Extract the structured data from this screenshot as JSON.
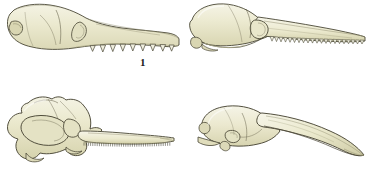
{
  "plate": {
    "title": "Comparative skull profiles plate",
    "background_color": "#ffffff",
    "width": 368,
    "height": 187,
    "layout": "2x2 grid of labeled skull illustrations"
  },
  "palette": {
    "bone_light": "#f2f1e0",
    "bone_mid": "#e8e6cc",
    "bone_shadow": "#d8d6b4",
    "bone_deep_shadow": "#c4c29c",
    "outline": "#4a4736",
    "outline_soft": "#6b6750",
    "tooth": "#efeede",
    "label_color": "#1a1a1a"
  },
  "figures": [
    {
      "id": "figure-1",
      "label": "1",
      "description": "Long low skull in left profile with broad posterior braincase, large orbit and elongate rostrum bearing widely spaced conical teeth",
      "teeth_count": 9,
      "teeth_style": "large-conical-spaced",
      "orientation": "snout-right"
    },
    {
      "id": "figure-2",
      "label": "2",
      "description": "Skull in left profile with bulbous domed braincase, rounded orbit and very long slender rostrum lined with numerous small sharp teeth",
      "teeth_count": 22,
      "teeth_style": "small-sharp-serial",
      "orientation": "snout-right"
    },
    {
      "id": "figure-3",
      "label": "3",
      "description": "Broad flaring posterior skull with very large orbit and long flattened spatulate rostrum edged with dense minute teeth",
      "teeth_count": 40,
      "teeth_style": "minute-dense-comb",
      "orientation": "snout-right"
    },
    {
      "id": "figure-4",
      "label": "4",
      "description": "Compact rounded braincase with a long smooth downcurved toothless beak",
      "teeth_count": 0,
      "teeth_style": "edentulous-beak",
      "orientation": "snout-right"
    }
  ]
}
